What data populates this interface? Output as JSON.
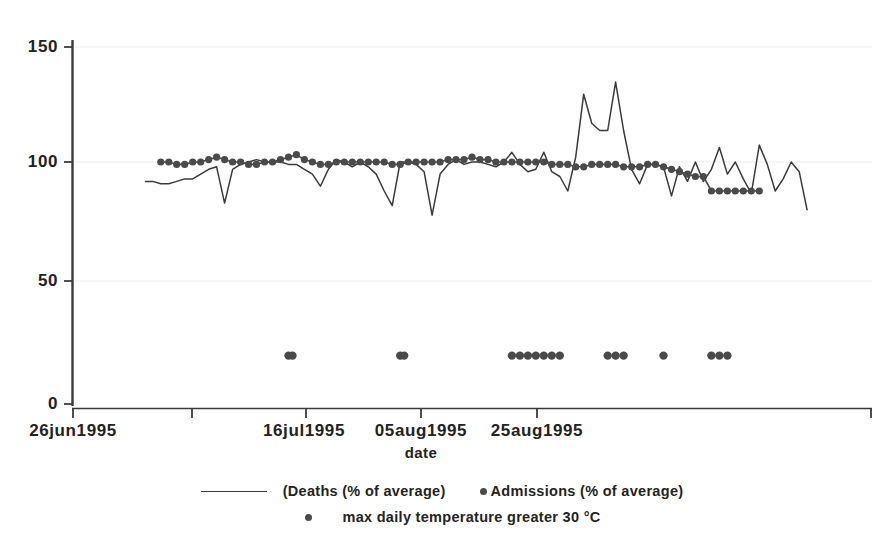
{
  "chart_data": {
    "type": "line",
    "title": "",
    "xlabel": "date",
    "ylabel": "",
    "ylim": [
      0,
      150
    ],
    "yticks": [
      0,
      50,
      100,
      150
    ],
    "ytick_labels": [
      "0",
      "50",
      "100",
      "150"
    ],
    "xticks": [
      "26jun1995",
      "16jul1995",
      "05aug1995",
      "25aug1995"
    ],
    "xtick_labels": [
      "26jun1995",
      "16jul1995",
      "05aug1995",
      "25aug1995"
    ],
    "x_range_days": [
      0,
      100
    ],
    "grid": "horizontal-faint",
    "legend_position": "below-axis",
    "series": [
      {
        "name": "(Deaths (% of average)",
        "type": "line",
        "marker": "none",
        "color": "#3a3a3a",
        "x_days": [
          9,
          10,
          11,
          12,
          13,
          14,
          15,
          16,
          17,
          18,
          19,
          20,
          21,
          22,
          23,
          24,
          25,
          26,
          27,
          28,
          29,
          30,
          31,
          32,
          33,
          34,
          35,
          36,
          37,
          38,
          39,
          40,
          41,
          42,
          43,
          44,
          45,
          46,
          47,
          48,
          49,
          50,
          51,
          52,
          53,
          54,
          55,
          56,
          57,
          58,
          59,
          60,
          61,
          62,
          63,
          64,
          65,
          66,
          67,
          68,
          69,
          70,
          71,
          72,
          73,
          74,
          75,
          76,
          77,
          78,
          79,
          80,
          81,
          82,
          83,
          84,
          85,
          86,
          87,
          88,
          89,
          90,
          91,
          92
        ],
        "values": [
          92,
          92,
          91,
          91,
          92,
          93,
          93,
          95,
          97,
          98,
          83,
          97,
          99,
          100,
          101,
          100,
          100,
          100,
          99,
          99,
          97,
          95,
          90,
          97,
          101,
          100,
          98,
          100,
          98,
          95,
          88,
          82,
          100,
          100,
          99,
          96,
          78,
          95,
          99,
          101,
          99,
          100,
          100,
          99,
          98,
          100,
          104,
          99,
          96,
          97,
          104,
          96,
          94,
          88,
          102,
          128,
          116,
          113,
          113,
          133,
          113,
          97,
          91,
          99,
          99,
          98,
          86,
          98,
          92,
          100,
          92,
          97,
          106,
          95,
          100,
          93,
          87,
          107,
          99,
          88,
          93,
          100,
          96,
          80
        ]
      },
      {
        "name": "Admissions (% of average)",
        "type": "line",
        "marker": "filled-circle",
        "color": "#4a4a4a",
        "x_days": [
          11,
          12,
          13,
          14,
          15,
          16,
          17,
          18,
          19,
          20,
          21,
          22,
          23,
          24,
          25,
          26,
          27,
          28,
          29,
          30,
          31,
          32,
          33,
          34,
          35,
          36,
          37,
          38,
          39,
          40,
          41,
          42,
          43,
          44,
          45,
          46,
          47,
          48,
          49,
          50,
          51,
          52,
          53,
          54,
          55,
          56,
          57,
          58,
          59,
          60,
          61,
          62,
          63,
          64,
          65,
          66,
          67,
          68,
          69,
          70,
          71,
          72,
          73,
          74,
          75,
          76,
          77,
          78,
          79,
          80,
          81,
          82,
          83,
          84,
          85,
          86
        ],
        "values": [
          100,
          100,
          99,
          99,
          100,
          100,
          101,
          102,
          101,
          100,
          100,
          99,
          99,
          100,
          100,
          101,
          102,
          103,
          101,
          100,
          99,
          99,
          100,
          100,
          100,
          100,
          100,
          100,
          100,
          99,
          99,
          100,
          100,
          100,
          100,
          100,
          101,
          101,
          101,
          102,
          101,
          101,
          100,
          100,
          100,
          100,
          100,
          100,
          100,
          99,
          99,
          99,
          98,
          98,
          99,
          99,
          99,
          99,
          98,
          98,
          98,
          99,
          99,
          98,
          97,
          96,
          95,
          94,
          94,
          88,
          88,
          88,
          88,
          88,
          88,
          88
        ]
      },
      {
        "name": "max daily temperature greater 30 °C",
        "type": "scatter",
        "marker": "filled-circle",
        "color": "#4a4a4a",
        "y_value": 20,
        "x_days": [
          27,
          27.5,
          41,
          41.5,
          55,
          56,
          57,
          58,
          59,
          60,
          61,
          67,
          68,
          69,
          74,
          80,
          81,
          82
        ]
      }
    ]
  },
  "legend": {
    "row1": {
      "deaths_label": "(Deaths (% of average)",
      "admissions_label": "Admissions (% of average)"
    },
    "row2": {
      "temperature_label": "max daily temperature greater 30 °C"
    }
  }
}
